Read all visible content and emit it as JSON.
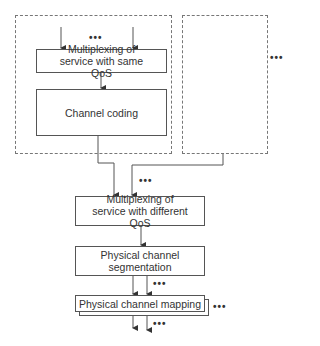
{
  "diagram": {
    "blocks": {
      "mux_same_qos": "Multiplexing of service with same QoS",
      "channel_coding": "Channel coding",
      "mux_diff_qos": "Multiplexing of service with different QoS",
      "segmentation": "Physical channel segmentation",
      "mapping": "Physical channel mapping"
    },
    "ellipsis": "•••",
    "groups": [
      "transport-channel-group-1",
      "transport-channel-group-n"
    ]
  }
}
